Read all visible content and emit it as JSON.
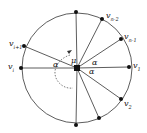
{
  "diagram": {
    "type": "circle-star",
    "center": {
      "x": 77,
      "y": 68
    },
    "radius": 55,
    "center_label": "μ",
    "angle_label": "α",
    "vertices": [
      {
        "id": "top",
        "x": 76,
        "y": 12,
        "label": ""
      },
      {
        "id": "vn-2",
        "x": 102,
        "y": 19,
        "label": "v",
        "sub": "n-2"
      },
      {
        "id": "vn-1",
        "x": 121,
        "y": 39,
        "label": "v",
        "sub": "n-1"
      },
      {
        "id": "v1",
        "x": 129,
        "y": 67,
        "label": "v",
        "sub": "1"
      },
      {
        "id": "v2",
        "x": 121,
        "y": 99,
        "label": "v",
        "sub": "2"
      },
      {
        "id": "bottom-right",
        "x": 99,
        "y": 118,
        "label": ""
      },
      {
        "id": "bottom",
        "x": 76,
        "y": 125,
        "label": ""
      },
      {
        "id": "vi",
        "x": 21,
        "y": 68,
        "label": "v",
        "sub": "i"
      },
      {
        "id": "vi+1",
        "x": 24,
        "y": 46,
        "label": "v",
        "sub": "i+1"
      }
    ],
    "labels": {
      "mu": "μ",
      "alpha1": "α",
      "alpha2": "α",
      "alpha3": "α",
      "v_n2": "v",
      "v_n2_sub": "n-2",
      "v_n1": "v",
      "v_n1_sub": "n-1",
      "v_1": "v",
      "v_1_sub": "1",
      "v_2": "v",
      "v_2_sub": "2",
      "v_i": "v",
      "v_i_sub": "i",
      "v_i1": "v",
      "v_i1_sub": "i+1"
    },
    "colors": {
      "stroke": "#222222",
      "dot": "#111111",
      "background": "#ffffff"
    }
  }
}
